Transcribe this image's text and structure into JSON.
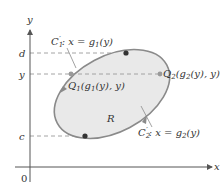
{
  "diagram": {
    "axes": {
      "x_label": "x",
      "y_label": "y",
      "origin_label": "0"
    },
    "y_ticks": {
      "d": "d",
      "y": "y",
      "c": "c"
    },
    "region_label": "R",
    "curves": {
      "c1": {
        "name": "C",
        "sub": "1",
        "prime": "′",
        "eq": ": x = g",
        "eq_sub": "1",
        "eq_tail": "(y)"
      },
      "c2": {
        "name": "C",
        "sub": "2",
        "prime": "′",
        "eq": ": x = g",
        "eq_sub": "2",
        "eq_tail": "(y)"
      }
    },
    "points": {
      "q1": {
        "name": "Q",
        "sub": "1",
        "open": "(g",
        "inner_sub": "1",
        "tail": "(y), y)"
      },
      "q2": {
        "name": "Q",
        "sub": "2",
        "open": "(g",
        "inner_sub": "2",
        "tail": "(y), y)"
      }
    },
    "colors": {
      "region_fill": "#e9e9e9",
      "curve_stroke": "#8a8a8a",
      "axis": "#555555",
      "dashed": "#9a9a9a",
      "dot": "#333333",
      "text": "#333333"
    }
  }
}
